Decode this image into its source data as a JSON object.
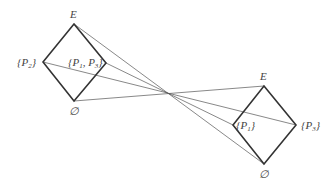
{
  "diagram": {
    "type": "lattice-duality",
    "left_lattice": {
      "top": "E",
      "left": "{P2}",
      "right": "{P1, P3}",
      "bottom": "∅"
    },
    "right_lattice": {
      "top": "E",
      "left": "{P1}",
      "right": "{P3}",
      "bottom": "∅"
    },
    "labels": {
      "left_top": "E",
      "left_bottom": "∅",
      "left_left_open": "{P",
      "left_left_sub": "2",
      "left_left_close": "}",
      "left_right_open": "{P",
      "left_right_sub1": "1",
      "left_right_mid": ", P",
      "left_right_sub2": "3",
      "left_right_close": "}",
      "right_top": "E",
      "right_bottom": "∅",
      "right_left_open": "{P",
      "right_left_sub": "1",
      "right_left_close": "}",
      "right_right_open": "{P",
      "right_right_sub": "3",
      "right_right_close": "}"
    },
    "colors": {
      "edge": "#333333",
      "ray": "#555555",
      "label": "#444444"
    }
  }
}
